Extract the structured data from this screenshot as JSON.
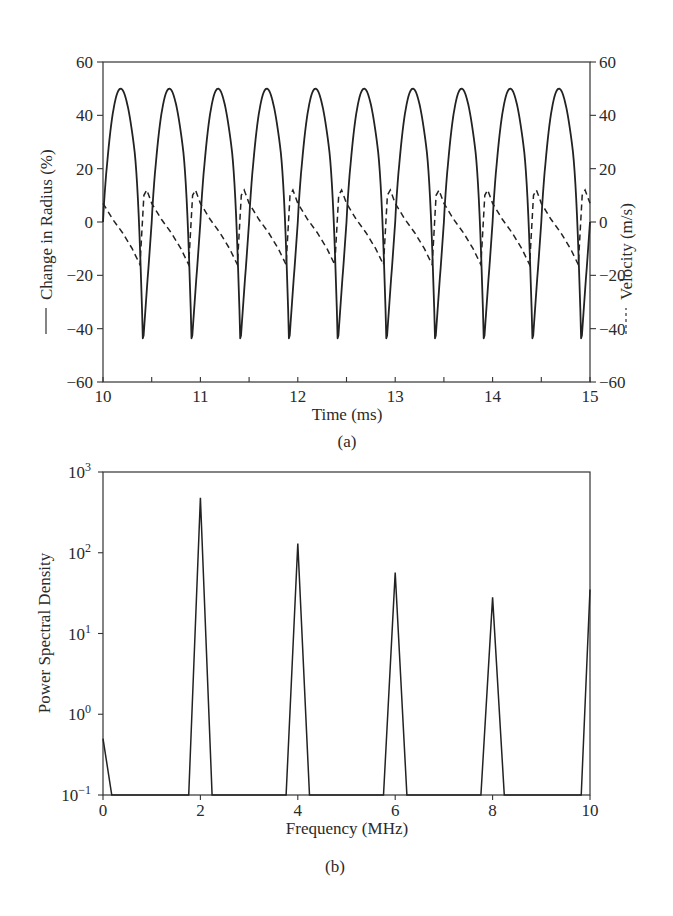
{
  "chart_data": [
    {
      "id": "a",
      "type": "line",
      "caption": "(a)",
      "title": "",
      "xlabel": "Time (ms)",
      "ylabel_left": "Change in Radius (%)",
      "ylabel_right": "Velocity (m/s)",
      "left_legend_style": "solid",
      "right_legend_style": "dashed",
      "xlim": [
        10,
        15
      ],
      "ylim_left": [
        -60,
        60
      ],
      "ylim_right": [
        -60,
        60
      ],
      "x_ticks": [
        "10",
        "11",
        "12",
        "13",
        "14",
        "15"
      ],
      "y_ticks_left": [
        "60",
        "40",
        "20",
        "0",
        "−20",
        "−40",
        "−60"
      ],
      "y_ticks_right": [
        "60",
        "40",
        "20",
        "0",
        "−20",
        "−40",
        "−60"
      ],
      "grid": false,
      "period_ms": 0.5,
      "series": [
        {
          "name": "Change in Radius (%)",
          "axis": "left",
          "style": "solid",
          "description": "periodic oscillation, 10 cycles; peaks ~50% at ~10.18+0.5k ms, sharp troughs ~-46% at ~10.41+0.5k ms",
          "peak_value": 50,
          "trough_value": -46,
          "x": [
            10.0,
            10.05,
            10.1,
            10.18,
            10.26,
            10.32,
            10.37,
            10.41,
            10.44,
            10.47,
            10.5
          ],
          "values": [
            0,
            30,
            45,
            50,
            43,
            25,
            -5,
            -46,
            -10,
            20,
            0
          ]
        },
        {
          "name": "Velocity (m/s)",
          "axis": "right",
          "style": "dashed",
          "description": "sawtooth-like; decays from ~12 to ~-16 m/s then jumps back up each cycle",
          "max_value": 12,
          "min_value": -16,
          "x": [
            10.0,
            10.1,
            10.2,
            10.3,
            10.38,
            10.42,
            10.45,
            10.5
          ],
          "values": [
            7,
            1,
            -4,
            -10,
            -16,
            10,
            12,
            7
          ]
        }
      ]
    },
    {
      "id": "b",
      "type": "line",
      "caption": "(b)",
      "title": "",
      "xlabel": "Frequency (MHz)",
      "ylabel": "Power Spectral Density",
      "yscale": "log",
      "xlim": [
        0,
        10
      ],
      "ylim": [
        0.1,
        1000
      ],
      "x_ticks": [
        "0",
        "2",
        "4",
        "6",
        "8",
        "10"
      ],
      "y_ticks": [
        {
          "base": "10",
          "exp": "3"
        },
        {
          "base": "10",
          "exp": "2"
        },
        {
          "base": "10",
          "exp": "1"
        },
        {
          "base": "10",
          "exp": "0"
        },
        {
          "base": "10",
          "exp": "−1"
        }
      ],
      "grid": false,
      "series": [
        {
          "name": "PSD",
          "style": "solid",
          "peaks": [
            {
              "freq_mhz": 0,
              "value": 0.5
            },
            {
              "freq_mhz": 2,
              "value": 480
            },
            {
              "freq_mhz": 4,
              "value": 130
            },
            {
              "freq_mhz": 6,
              "value": 57
            },
            {
              "freq_mhz": 8,
              "value": 28
            },
            {
              "freq_mhz": 10,
              "value": 35
            }
          ],
          "baseline": 0.1
        }
      ]
    }
  ]
}
